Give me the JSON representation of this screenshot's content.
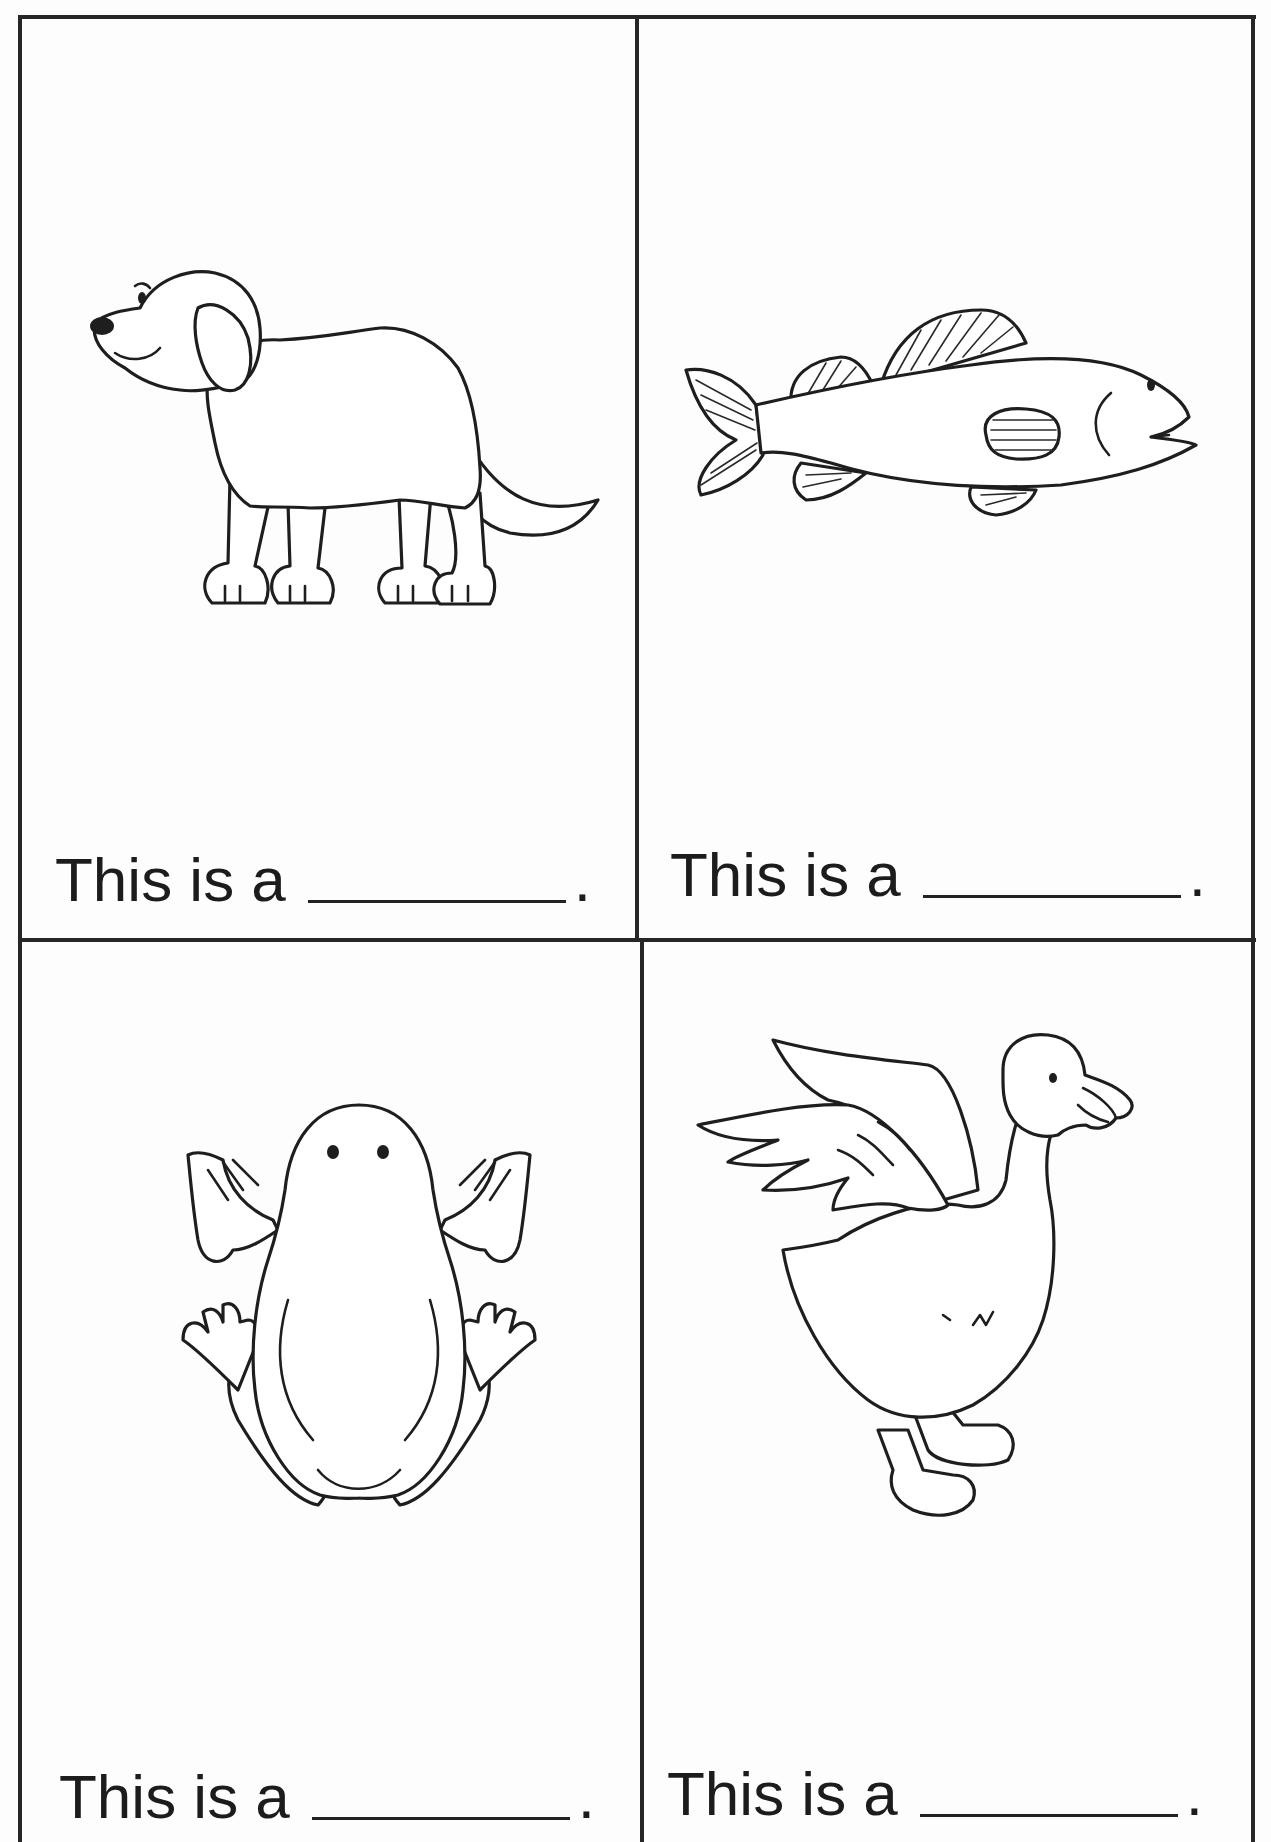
{
  "worksheet": {
    "layout": "2x2 grid of picture cards",
    "border_color": "#262626",
    "cells": [
      {
        "position": "top-left",
        "picture": "dog",
        "prompt": "This is a",
        "answer_blank": "",
        "end_punctuation": "."
      },
      {
        "position": "top-right",
        "picture": "fish",
        "prompt": "This is a",
        "answer_blank": "",
        "end_punctuation": "."
      },
      {
        "position": "bottom-left",
        "picture": "frog",
        "prompt": "This is a",
        "answer_blank": "",
        "end_punctuation": "."
      },
      {
        "position": "bottom-right",
        "picture": "duck",
        "prompt": "This is a",
        "answer_blank": "",
        "end_punctuation": "."
      }
    ]
  }
}
